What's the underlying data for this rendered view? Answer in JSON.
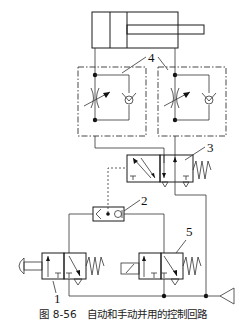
{
  "diagram": {
    "title": "图 8-56　自动和手动并用的控制回路",
    "caption_number": "图 8-56",
    "caption_text": "自动和手动并用的控制回路",
    "components": [
      {
        "id": "cylinder",
        "label": "",
        "type": "double-acting-cylinder"
      },
      {
        "id": "4",
        "label": "4",
        "type": "one-way-flow-control-valve (pair)"
      },
      {
        "id": "3",
        "label": "3",
        "type": "pilot-operated 2-position directional valve with spring return"
      },
      {
        "id": "2",
        "label": "2",
        "type": "shuttle valve (OR)"
      },
      {
        "id": "1",
        "label": "1",
        "type": "manual push-button 2-position valve with spring return"
      },
      {
        "id": "5",
        "label": "5",
        "type": "solenoid-operated 2-position valve with spring return"
      },
      {
        "id": "source",
        "label": "",
        "type": "air supply (triangle)"
      }
    ],
    "labels": {
      "l1": "1",
      "l2": "2",
      "l3": "3",
      "l4": "4",
      "l5": "5"
    }
  }
}
